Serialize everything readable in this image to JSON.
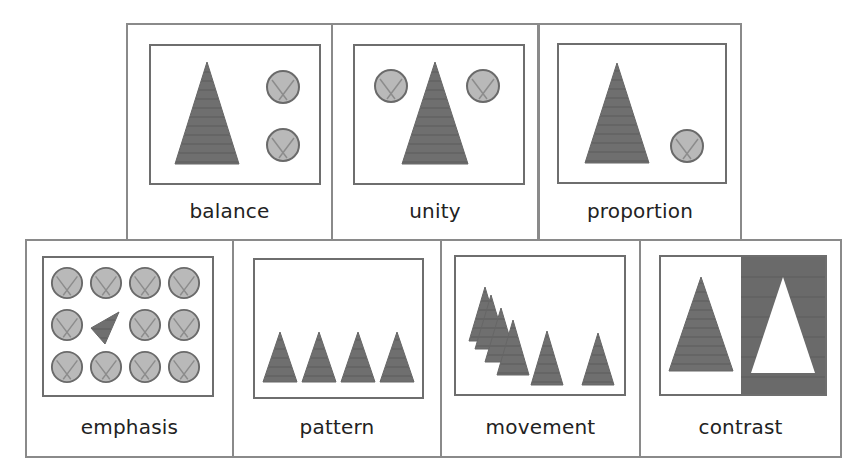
{
  "colors": {
    "border": "#8a8a8a",
    "frame": "#6e6e6e",
    "triangle": "#6f6f6f",
    "circle_fill": "#b9b9b9",
    "circle_stroke": "#6a6a6a",
    "dark_panel": "#6a6a6a"
  },
  "cards": [
    {
      "id": "balance",
      "label": "balance"
    },
    {
      "id": "unity",
      "label": "unity"
    },
    {
      "id": "proportion",
      "label": "proportion"
    },
    {
      "id": "emphasis",
      "label": "emphasis"
    },
    {
      "id": "pattern",
      "label": "pattern"
    },
    {
      "id": "movement",
      "label": "movement"
    },
    {
      "id": "contrast",
      "label": "contrast"
    }
  ]
}
